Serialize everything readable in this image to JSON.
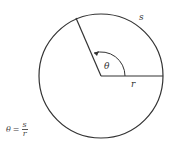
{
  "diagram": {
    "labels": {
      "arc": "s",
      "radius": "r",
      "angle": "θ"
    },
    "formula": {
      "lhs": "θ",
      "eq": "=",
      "numerator": "s",
      "denominator": "r"
    },
    "colors": {
      "stroke": "#333333",
      "background": "#ffffff"
    }
  }
}
